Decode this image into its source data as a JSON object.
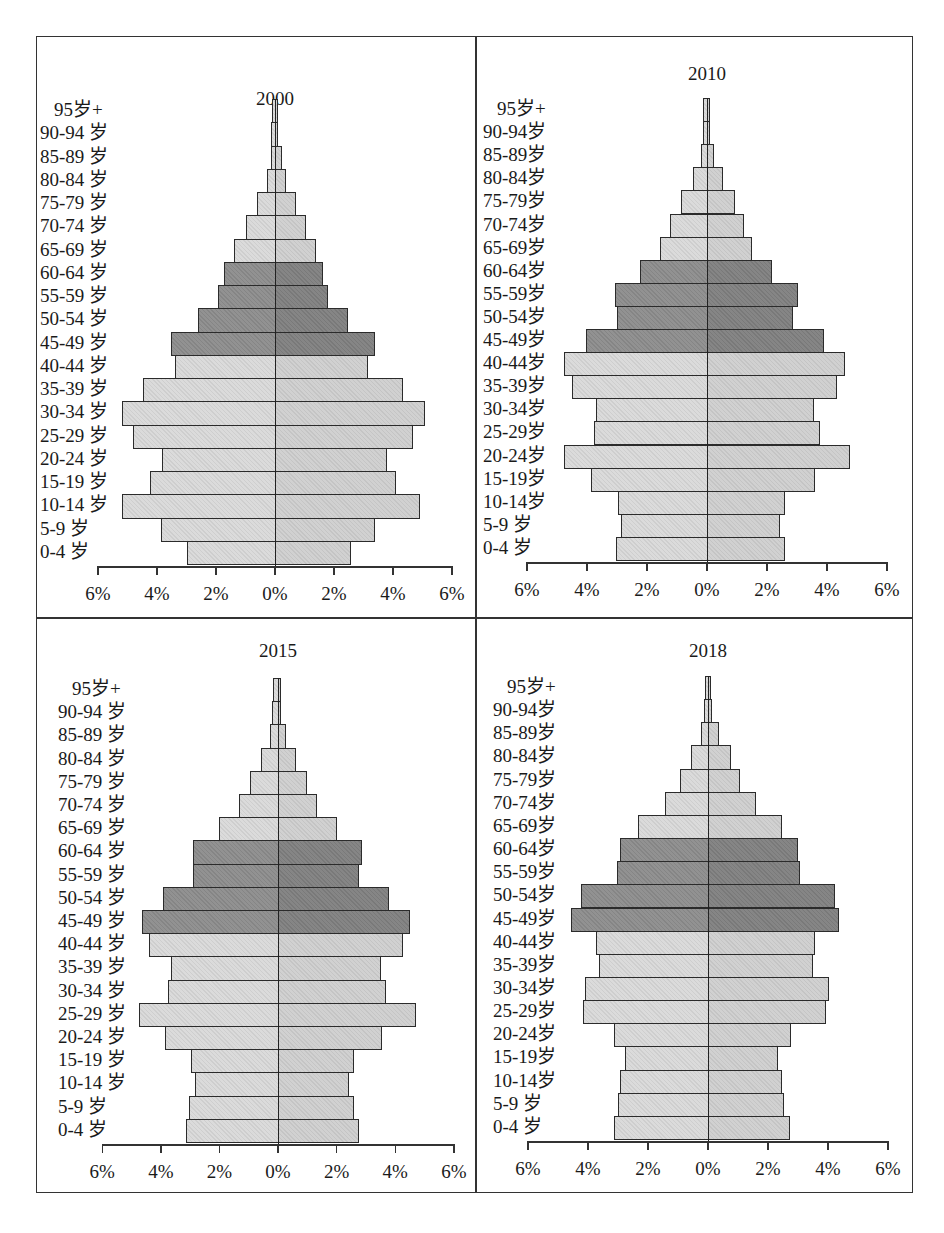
{
  "figure": {
    "age_groups": [
      "95岁+",
      "90-94 岁",
      "85-89 岁",
      "80-84 岁",
      "75-79 岁",
      "70-74 岁",
      "65-69 岁",
      "60-64 岁",
      "55-59 岁",
      "50-54 岁",
      "45-49 岁",
      "40-44 岁",
      "35-39 岁",
      "30-34 岁",
      "25-29 岁",
      "20-24 岁",
      "15-19 岁",
      "10-14 岁",
      "5-9 岁",
      "0-4 岁"
    ],
    "x_ticks": [
      "6%",
      "4%",
      "2%",
      "0%",
      "2%",
      "4%",
      "6%"
    ],
    "colors": {
      "light_left": "#d9d9d9",
      "light_right": "#cfcfcf",
      "dark_left": "#8c8c8c",
      "dark_right": "#7f7f7f",
      "border": "#2b2b2b"
    }
  },
  "chart_data": [
    {
      "type": "bar",
      "subtype": "population-pyramid",
      "title": "2000",
      "categories": [
        "95岁+",
        "90-94 岁",
        "85-89 岁",
        "80-84 岁",
        "75-79 岁",
        "70-74 岁",
        "65-69 岁",
        "60-64 岁",
        "55-59 岁",
        "50-54 岁",
        "45-49 岁",
        "40-44 岁",
        "35-39 岁",
        "30-34 岁",
        "25-29 岁",
        "20-24 岁",
        "15-19 岁",
        "10-14 岁",
        "5-9 岁",
        "0-4 岁"
      ],
      "series": [
        {
          "name": "left",
          "values": [
            0.05,
            0.13,
            0.15,
            0.27,
            0.6,
            1.0,
            1.4,
            1.73,
            1.93,
            2.6,
            3.53,
            3.39,
            4.47,
            5.19,
            4.8,
            3.83,
            4.24,
            5.17,
            3.86,
            2.98
          ]
        },
        {
          "name": "right",
          "values": [
            0.05,
            0.1,
            0.25,
            0.37,
            0.7,
            1.05,
            1.4,
            1.63,
            1.8,
            2.47,
            3.39,
            3.15,
            4.34,
            5.08,
            4.68,
            3.8,
            4.1,
            4.93,
            3.38,
            2.57
          ]
        }
      ],
      "highlighted_groups": [
        "60-64 岁",
        "55-59 岁",
        "50-54 岁",
        "45-49 岁"
      ],
      "xlabel": "",
      "ylabel": "",
      "xlim": [
        -6,
        6
      ],
      "x_tick_labels": [
        "6%",
        "4%",
        "2%",
        "0%",
        "2%",
        "4%",
        "6%"
      ],
      "grid": false
    },
    {
      "type": "bar",
      "subtype": "population-pyramid",
      "title": "2010",
      "categories": [
        "95岁+",
        "90-94岁",
        "85-89岁",
        "80-84岁",
        "75-79岁",
        "70-74岁",
        "65-69岁",
        "60-64岁",
        "55-59岁",
        "50-54岁",
        "45-49岁",
        "40-44岁",
        "35-39岁",
        "30-34岁",
        "25-29岁",
        "20-24岁",
        "15-19岁",
        "10-14岁",
        "5-9 岁",
        "0-4 岁"
      ],
      "series": [
        {
          "name": "left",
          "values": [
            0.13,
            0.15,
            0.2,
            0.47,
            0.87,
            1.23,
            1.57,
            2.23,
            3.07,
            3.0,
            4.03,
            4.77,
            4.5,
            3.7,
            3.77,
            4.77,
            3.87,
            2.97,
            2.87,
            3.03
          ]
        },
        {
          "name": "right",
          "values": [
            0.07,
            0.1,
            0.23,
            0.53,
            0.93,
            1.23,
            1.5,
            2.17,
            3.03,
            2.87,
            3.9,
            4.6,
            4.33,
            3.57,
            3.77,
            4.77,
            3.6,
            2.6,
            2.43,
            2.6
          ]
        }
      ],
      "highlighted_groups": [
        "60-64岁",
        "55-59岁",
        "50-54岁",
        "45-49岁"
      ],
      "xlabel": "",
      "ylabel": "",
      "xlim": [
        -6,
        6
      ],
      "x_tick_labels": [
        "6%",
        "4%",
        "2%",
        "0%",
        "2%",
        "4%",
        "6%"
      ],
      "grid": false
    },
    {
      "type": "bar",
      "subtype": "population-pyramid",
      "title": "2015",
      "categories": [
        "95岁+",
        "90-94 岁",
        "85-89 岁",
        "80-84 岁",
        "75-79 岁",
        "70-74 岁",
        "65-69 岁",
        "60-64 岁",
        "55-59 岁",
        "50-54 岁",
        "45-49 岁",
        "40-44 岁",
        "35-39 岁",
        "30-34 岁",
        "25-29 岁",
        "20-24 岁",
        "15-19 岁",
        "10-14 岁",
        "5-9 岁",
        "0-4 岁"
      ],
      "series": [
        {
          "name": "left",
          "values": [
            0.16,
            0.2,
            0.27,
            0.57,
            0.95,
            1.33,
            2.02,
            2.89,
            2.89,
            3.91,
            4.63,
            4.41,
            3.65,
            3.77,
            4.74,
            3.84,
            2.96,
            2.83,
            3.04,
            3.15
          ]
        },
        {
          "name": "right",
          "values": [
            0.05,
            0.1,
            0.27,
            0.6,
            0.98,
            1.33,
            2.0,
            2.87,
            2.76,
            3.79,
            4.52,
            4.28,
            3.5,
            3.69,
            4.72,
            3.55,
            2.58,
            2.41,
            2.58,
            2.75
          ]
        }
      ],
      "highlighted_groups": [
        "60-64 岁",
        "55-59 岁",
        "50-54 岁",
        "45-49 岁"
      ],
      "xlabel": "",
      "ylabel": "",
      "xlim": [
        -6,
        6
      ],
      "x_tick_labels": [
        "6%",
        "4%",
        "2%",
        "0%",
        "2%",
        "4%",
        "6%"
      ],
      "grid": false
    },
    {
      "type": "bar",
      "subtype": "population-pyramid",
      "title": "2018",
      "categories": [
        "95岁+",
        "90-94岁",
        "85-89岁",
        "80-84岁",
        "75-79岁",
        "70-74岁",
        "65-69岁",
        "60-64岁",
        "55-59岁",
        "50-54岁",
        "45-49岁",
        "40-44岁",
        "35-39岁",
        "30-34岁",
        "25-29岁",
        "20-24岁",
        "15-19岁",
        "10-14岁",
        "5-9 岁",
        "0-4 岁"
      ],
      "series": [
        {
          "name": "left",
          "values": [
            0.1,
            0.13,
            0.23,
            0.57,
            0.93,
            1.43,
            2.33,
            2.93,
            3.03,
            4.23,
            4.57,
            3.73,
            3.63,
            4.1,
            4.17,
            3.13,
            2.77,
            2.93,
            3.0,
            3.13
          ]
        },
        {
          "name": "right",
          "values": [
            0.1,
            0.13,
            0.37,
            0.77,
            1.07,
            1.6,
            2.47,
            3.0,
            3.07,
            4.23,
            4.37,
            3.57,
            3.5,
            4.03,
            3.93,
            2.77,
            2.33,
            2.47,
            2.53,
            2.73
          ]
        }
      ],
      "highlighted_groups": [
        "60-64岁",
        "55-59岁",
        "50-54岁",
        "45-49岁"
      ],
      "xlabel": "",
      "ylabel": "",
      "xlim": [
        -6,
        6
      ],
      "x_tick_labels": [
        "6%",
        "4%",
        "2%",
        "0%",
        "2%",
        "4%",
        "6%"
      ],
      "grid": false
    }
  ]
}
